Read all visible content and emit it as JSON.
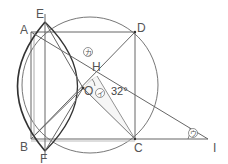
{
  "diagram": {
    "type": "geometry-figure",
    "points": {
      "A": {
        "label": "A",
        "x": 31,
        "y": 32
      },
      "B": {
        "label": "B",
        "x": 31,
        "y": 139
      },
      "C": {
        "label": "C",
        "x": 135,
        "y": 139
      },
      "D": {
        "label": "D",
        "x": 135,
        "y": 32
      },
      "E": {
        "label": "E",
        "x": 45,
        "y": 22
      },
      "F": {
        "label": "F",
        "x": 45,
        "y": 151
      },
      "H": {
        "label": "H",
        "x": 97,
        "y": 76
      },
      "O": {
        "label": "O",
        "x": 83,
        "y": 88
      },
      "I": {
        "label": "I",
        "x": 208,
        "y": 139
      }
    },
    "angle_value": "32°",
    "angle_marks": {
      "ka": "カ",
      "i": "イ",
      "u": "ウ"
    },
    "colors": {
      "line": "#666666",
      "thick_arc": "#333333",
      "circle": "#777777",
      "shade": "#cccccc"
    }
  }
}
